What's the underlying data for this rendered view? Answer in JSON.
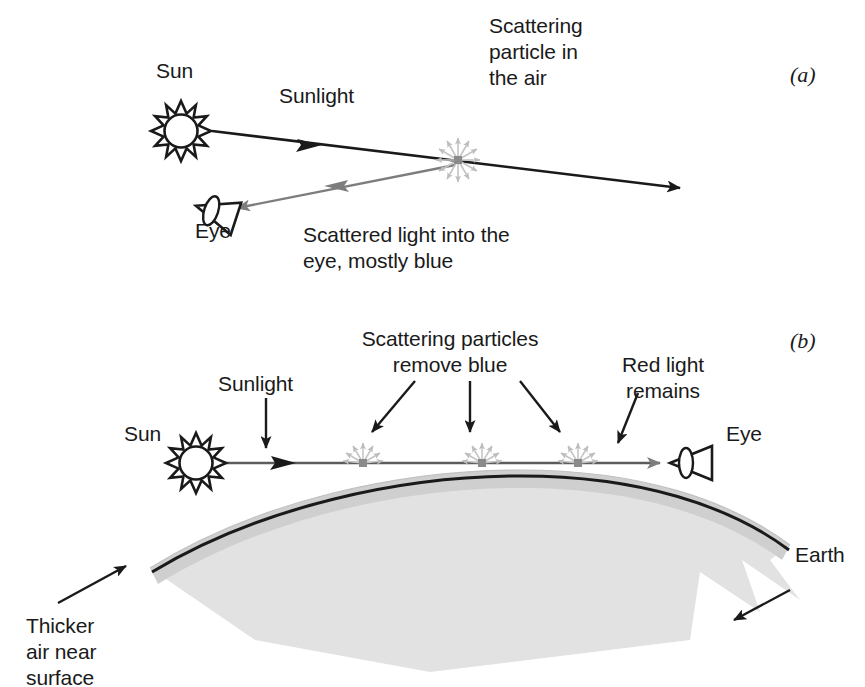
{
  "figure": {
    "background_color": "#ffffff",
    "ink_color": "#1a1a1a",
    "ray_color": "#1a1a1a",
    "scattered_ray_color": "#7d7d7d",
    "particle_color": "#b4b4b4",
    "earth_fill": "#e2e2e2",
    "atmosphere_fill": "#cfcfcf"
  },
  "panel_a": {
    "tag": "(a)",
    "labels": {
      "sun": "Sun",
      "sunlight": "Sunlight",
      "particle": "Scattering\nparticle in\nthe air",
      "eye": "Eye",
      "scattered": "Scattered light into the\neye, mostly blue"
    },
    "icons": {
      "sun": "sun-icon",
      "eye": "eye-icon",
      "particle": "scattering-particle-icon"
    }
  },
  "panel_b": {
    "tag": "(b)",
    "labels": {
      "sun": "Sun",
      "sunlight": "Sunlight",
      "remove_blue": "Scattering particles\nremove blue",
      "red_remains": "Red light\nremains",
      "eye": "Eye",
      "earth": "Earth",
      "thicker_air": "Thicker\nair near\nsurface"
    },
    "icons": {
      "sun": "sun-icon",
      "eye": "eye-icon",
      "particle": "scattering-particle-icon"
    },
    "particle_count": 3
  }
}
